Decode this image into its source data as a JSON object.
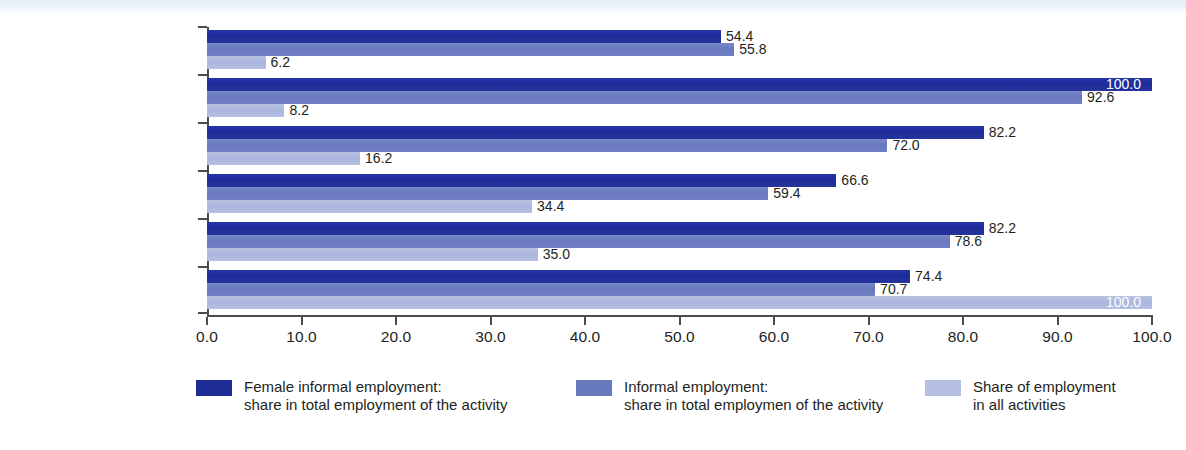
{
  "chart_data": {
    "type": "bar",
    "orientation": "horizontal",
    "title": "",
    "xlabel": "",
    "ylabel": "",
    "xlim": [
      0,
      100
    ],
    "xticks": [
      "0.0",
      "10.0",
      "20.0",
      "30.0",
      "40.0",
      "50.0",
      "60.0",
      "70.0",
      "80.0",
      "90.0",
      "100.0"
    ],
    "grid": false,
    "legend_position": "bottom",
    "categories": [
      "Transportation",
      "Construction",
      "Manufacturing",
      "Services other than trade\nor transportation",
      "Trade",
      "All non-agricultural\nactivities"
    ],
    "series": [
      {
        "name": "Female informal employment:\nshare in total employment of the activity",
        "color": "#1e2c96",
        "values": [
          54.4,
          100.0,
          82.2,
          66.6,
          82.2,
          74.4
        ],
        "labels": [
          "54.4",
          "100.0",
          "82.2",
          "66.6",
          "82.2",
          "74.4"
        ]
      },
      {
        "name": "Informal employment:\nshare in total employmen of the activity",
        "color": "#6778bd",
        "values": [
          55.8,
          92.6,
          72.0,
          59.4,
          78.6,
          70.7
        ],
        "labels": [
          "55.8",
          "92.6",
          "72.0",
          "59.4",
          "78.6",
          "70.7"
        ]
      },
      {
        "name": "Share of employment\nin all activities",
        "color": "#b4bfe3",
        "values": [
          6.2,
          8.2,
          16.2,
          34.4,
          35.0,
          100.0
        ],
        "labels": [
          "6.2",
          "8.2",
          "16.2",
          "34.4",
          "35.0",
          "100.0"
        ]
      }
    ]
  },
  "legend": {
    "items": [
      {
        "label": "Female informal employment:\nshare in total employment of the activity",
        "color": "#1e2c96"
      },
      {
        "label": "Informal employment:\nshare in total employmen of the activity",
        "color": "#6778bd"
      },
      {
        "label": "Share of employment\nin all activities",
        "color": "#b4bfe3"
      }
    ]
  }
}
